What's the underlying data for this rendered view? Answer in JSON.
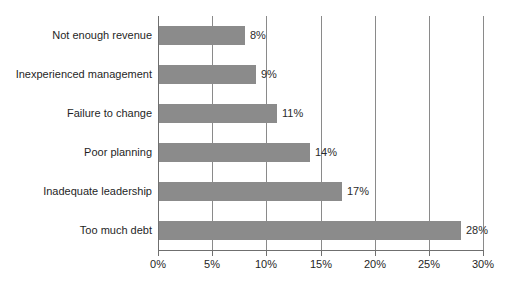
{
  "chart_data": {
    "type": "bar",
    "orientation": "horizontal",
    "title": "",
    "subtitle": "",
    "xlabel": "",
    "ylabel": "",
    "categories": [
      "Not enough revenue",
      "Inexperienced management",
      "Failure to change",
      "Poor planning",
      "Inadequate leadership",
      "Too much debt"
    ],
    "values": [
      8,
      9,
      11,
      14,
      17,
      28
    ],
    "value_labels": [
      "8%",
      "9%",
      "11%",
      "14%",
      "17%",
      "28%"
    ],
    "xlim": [
      0,
      30
    ],
    "xticks": [
      0,
      5,
      10,
      15,
      20,
      25,
      30
    ],
    "xtick_labels": [
      "0%",
      "5%",
      "10%",
      "15%",
      "20%",
      "25%",
      "30%"
    ],
    "grid": "vertical",
    "legend": "none",
    "bar_color": "#8b8b8b",
    "gridline_color": "#8a8a8a",
    "axis_color": "#6f6f6f",
    "text_color": "#1f1f1f",
    "background_color": "#ffffff"
  }
}
